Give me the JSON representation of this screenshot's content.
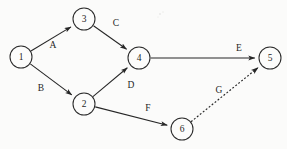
{
  "diagram": {
    "type": "directed-activity-network",
    "canvas": {
      "width": 287,
      "height": 149
    },
    "background_color": "#fbfbfa",
    "stroke_color": "#262626",
    "label_color": "#1f1f1f",
    "node_radius": 11,
    "nodes": [
      {
        "id": "1",
        "label": "1",
        "cx": 21,
        "cy": 57
      },
      {
        "id": "3",
        "label": "3",
        "cx": 84,
        "cy": 19
      },
      {
        "id": "2",
        "label": "2",
        "cx": 84,
        "cy": 104
      },
      {
        "id": "4",
        "label": "4",
        "cx": 139,
        "cy": 58
      },
      {
        "id": "6",
        "label": "6",
        "cx": 182,
        "cy": 129
      },
      {
        "id": "5",
        "label": "5",
        "cx": 270,
        "cy": 58
      }
    ],
    "edges": [
      {
        "id": "A",
        "label": "A",
        "from": "1",
        "to": "3",
        "style": "solid",
        "arrow": true,
        "label_x": 53,
        "label_y": 45
      },
      {
        "id": "B",
        "label": "B",
        "from": "1",
        "to": "2",
        "style": "solid",
        "arrow": true,
        "label_x": 41,
        "label_y": 88
      },
      {
        "id": "C",
        "label": "C",
        "from": "3",
        "to": "4",
        "style": "solid",
        "arrow": true,
        "label_x": 116,
        "label_y": 23
      },
      {
        "id": "D",
        "label": "D",
        "from": "2",
        "to": "4",
        "style": "solid",
        "arrow": true,
        "label_x": 131,
        "label_y": 85
      },
      {
        "id": "E",
        "label": "E",
        "from": "4",
        "to": "5",
        "style": "solid",
        "arrow": true,
        "label_x": 239,
        "label_y": 48
      },
      {
        "id": "F",
        "label": "F",
        "from": "2",
        "to": "6",
        "style": "solid",
        "arrow": true,
        "label_x": 148,
        "label_y": 108
      },
      {
        "id": "G",
        "label": "G",
        "from": "6",
        "to": "5",
        "style": "dotted",
        "arrow": true,
        "label_x": 219,
        "label_y": 90
      }
    ]
  }
}
